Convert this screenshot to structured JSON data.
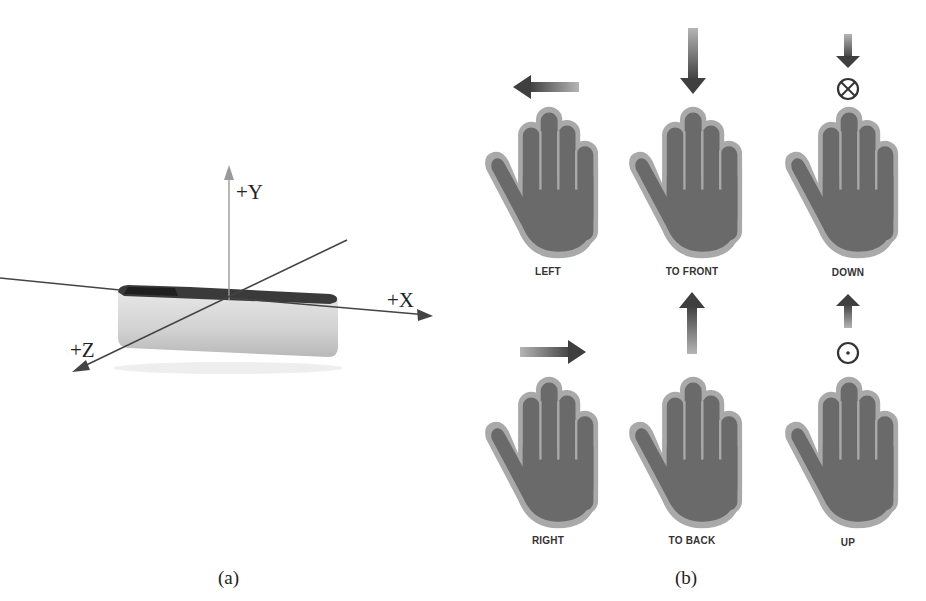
{
  "figure": {
    "panel_a": {
      "caption": "(a)",
      "axes": {
        "y_label": "+Y",
        "x_label": "+X",
        "z_label": "+Z"
      },
      "device": "sensor-bar",
      "colors": {
        "axis": "#444444",
        "y_axis": "#9a9a9a",
        "device_body": "#dcdcdc",
        "device_top": "#3a3a3a"
      }
    },
    "panel_b": {
      "caption": "(b)",
      "gestures": [
        {
          "label": "LEFT",
          "indicator": "arrow-left"
        },
        {
          "label": "TO FRONT",
          "indicator": "arrow-down"
        },
        {
          "label": "DOWN",
          "indicator": "arrow-down-with-cross-circle"
        },
        {
          "label": "RIGHT",
          "indicator": "arrow-right"
        },
        {
          "label": "TO BACK",
          "indicator": "arrow-up"
        },
        {
          "label": "UP",
          "indicator": "arrow-up-with-dot-circle"
        }
      ],
      "colors": {
        "hand_fill": "#6b6b6b",
        "hand_outline": "#a8a8a8",
        "arrow": "#4a4a4a"
      }
    }
  }
}
